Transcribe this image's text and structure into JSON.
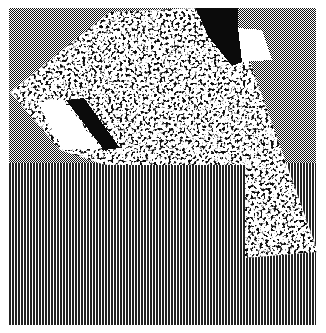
{
  "image": {
    "description": "Monochrome dithered bitmap artwork",
    "width": 326,
    "height": 333,
    "colors": {
      "background": "#ffffff",
      "ink": "#111111",
      "paper": "#ffffff"
    },
    "regions": {
      "checkerboard_band": {
        "x": 9,
        "y": 8,
        "width": 307,
        "height": 155,
        "pattern": "checkerboard-2px"
      },
      "stripe_band": {
        "x": 9,
        "y": 163,
        "width": 307,
        "height": 162,
        "pattern": "vertical-stripes-2px"
      },
      "noise_square": {
        "points": [
          [
            10,
            92
          ],
          [
            110,
            12
          ],
          [
            195,
            8
          ],
          [
            238,
            28
          ],
          [
            318,
            252
          ],
          [
            245,
            258
          ],
          [
            245,
            165
          ],
          [
            105,
            165
          ]
        ],
        "pattern": "random-dither"
      },
      "black_wedges": [
        {
          "points": [
            [
              195,
              8
            ],
            [
              238,
              8
            ],
            [
              240,
              30
            ],
            [
              228,
              58
            ],
            [
              220,
              62
            ]
          ]
        },
        {
          "points": [
            [
              62,
              100
            ],
            [
              85,
              98
            ],
            [
              118,
              150
            ],
            [
              100,
              148
            ]
          ]
        }
      ],
      "white_wedges": [
        {
          "points": [
            [
              38,
              100
            ],
            [
              62,
              100
            ],
            [
              100,
              148
            ],
            [
              63,
              150
            ]
          ]
        },
        {
          "points": [
            [
              240,
              28
            ],
            [
              262,
              30
            ],
            [
              270,
              58
            ],
            [
              236,
              62
            ]
          ]
        }
      ]
    },
    "alt_text": "Dithered bitmap illustration"
  }
}
